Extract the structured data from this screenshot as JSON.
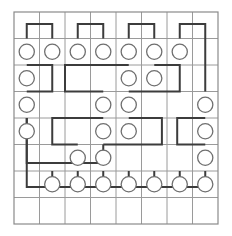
{
  "diagram": {
    "type": "grid-link-diagram",
    "colors": {
      "background": "#ffffff",
      "grid_line": "#9a9a9a",
      "border_line": "#8a8a8a",
      "path_stroke": "#3c3c3c",
      "node_stroke": "#6f6f6f",
      "node_fill": "#ffffff"
    },
    "grid": {
      "columns": 8,
      "rows": 8,
      "origin_x": 14,
      "origin_y": 12,
      "cell_width": 25.5,
      "cell_height": 26.5,
      "line_width": 1,
      "border_width": 1.2
    },
    "node_radius": 7.6,
    "node_stroke_width": 1.3,
    "path_stroke_width": 2.0,
    "nodes": [
      {
        "id": "n1",
        "col": 0,
        "row": 1
      },
      {
        "id": "n2",
        "col": 1,
        "row": 1
      },
      {
        "id": "n3",
        "col": 2,
        "row": 1
      },
      {
        "id": "n4",
        "col": 3,
        "row": 1
      },
      {
        "id": "n5",
        "col": 4,
        "row": 1
      },
      {
        "id": "n6",
        "col": 5,
        "row": 1
      },
      {
        "id": "n7",
        "col": 6,
        "row": 1
      },
      {
        "id": "n8",
        "col": 0,
        "row": 2
      },
      {
        "id": "n9",
        "col": 4,
        "row": 2
      },
      {
        "id": "n10",
        "col": 5,
        "row": 2
      },
      {
        "id": "n11",
        "col": 0,
        "row": 3
      },
      {
        "id": "n12",
        "col": 3,
        "row": 3
      },
      {
        "id": "n13",
        "col": 4,
        "row": 3
      },
      {
        "id": "n14",
        "col": 7,
        "row": 3
      },
      {
        "id": "n15",
        "col": 0,
        "row": 4
      },
      {
        "id": "n16",
        "col": 3,
        "row": 4
      },
      {
        "id": "n17",
        "col": 4,
        "row": 4
      },
      {
        "id": "n18",
        "col": 7,
        "row": 4
      },
      {
        "id": "n19",
        "col": 2,
        "row": 5
      },
      {
        "id": "n20",
        "col": 3,
        "row": 5
      },
      {
        "id": "n21",
        "col": 7,
        "row": 5
      },
      {
        "id": "n22",
        "col": 1,
        "row": 6
      },
      {
        "id": "n23",
        "col": 2,
        "row": 6
      },
      {
        "id": "n24",
        "col": 3,
        "row": 6
      },
      {
        "id": "n25",
        "col": 4,
        "row": 6
      },
      {
        "id": "n26",
        "col": 5,
        "row": 6
      },
      {
        "id": "n27",
        "col": 6,
        "row": 6
      },
      {
        "id": "n28",
        "col": 7,
        "row": 6
      }
    ],
    "links": [
      {
        "id": "l1",
        "from": "n1",
        "to": "n2",
        "waypoints": [
          [
            0.5,
            1.0
          ],
          [
            0.5,
            0.45
          ],
          [
            1.5,
            0.45
          ],
          [
            1.5,
            1.0
          ]
        ]
      },
      {
        "id": "l2",
        "from": "n3",
        "to": "n4",
        "waypoints": [
          [
            2.5,
            1.0
          ],
          [
            2.5,
            0.45
          ],
          [
            3.5,
            0.45
          ],
          [
            3.5,
            1.0
          ]
        ]
      },
      {
        "id": "l3",
        "from": "n5",
        "to": "n6",
        "waypoints": [
          [
            4.5,
            1.0
          ],
          [
            4.5,
            0.45
          ],
          [
            5.5,
            0.45
          ],
          [
            5.5,
            1.0
          ]
        ]
      },
      {
        "id": "l4",
        "from": "n7",
        "to": "n14",
        "waypoints": [
          [
            6.5,
            1.0
          ],
          [
            6.5,
            0.45
          ],
          [
            7.5,
            0.45
          ],
          [
            7.5,
            3.0
          ]
        ]
      },
      {
        "id": "l5",
        "from": "n8",
        "to": "n11",
        "waypoints": [
          [
            0.5,
            2.0
          ],
          [
            1.5,
            2.0
          ],
          [
            1.5,
            3.0
          ],
          [
            0.5,
            3.0
          ]
        ]
      },
      {
        "id": "l6",
        "from": "n9",
        "to": "n12",
        "waypoints": [
          [
            4.5,
            2.0
          ],
          [
            2.0,
            2.0
          ],
          [
            2.0,
            3.0
          ],
          [
            3.5,
            3.0
          ]
        ]
      },
      {
        "id": "l7",
        "from": "n10",
        "to": "n13",
        "waypoints": [
          [
            5.5,
            2.0
          ],
          [
            6.5,
            2.0
          ],
          [
            6.5,
            3.0
          ],
          [
            4.5,
            3.0
          ]
        ]
      },
      {
        "id": "l8",
        "from": "n15",
        "to": "n20",
        "waypoints": [
          [
            0.5,
            4.0
          ],
          [
            0.5,
            5.7
          ],
          [
            3.5,
            5.7
          ],
          [
            3.5,
            5.0
          ]
        ]
      },
      {
        "id": "l9",
        "from": "n16",
        "to": "n19",
        "waypoints": [
          [
            3.5,
            4.0
          ],
          [
            1.5,
            4.0
          ],
          [
            1.5,
            5.0
          ],
          [
            2.5,
            5.0
          ]
        ]
      },
      {
        "id": "l10",
        "from": "n17",
        "to": "n20",
        "waypoints": [
          [
            4.5,
            4.0
          ],
          [
            5.8,
            4.0
          ],
          [
            5.8,
            5.0
          ],
          [
            3.5,
            5.0
          ]
        ]
      },
      {
        "id": "l11",
        "from": "n18",
        "to": "n21",
        "waypoints": [
          [
            7.5,
            4.0
          ],
          [
            6.4,
            4.0
          ],
          [
            6.4,
            5.0
          ],
          [
            7.5,
            5.0
          ]
        ]
      },
      {
        "id": "l12",
        "from": "n22",
        "to": "n23",
        "waypoints": [
          [
            1.5,
            6.0
          ],
          [
            1.5,
            6.6
          ],
          [
            2.5,
            6.6
          ],
          [
            2.5,
            6.0
          ]
        ]
      },
      {
        "id": "l13",
        "from": "n24",
        "to": "n25",
        "waypoints": [
          [
            3.5,
            6.0
          ],
          [
            3.5,
            6.6
          ],
          [
            4.5,
            6.6
          ],
          [
            4.5,
            6.0
          ]
        ]
      },
      {
        "id": "l14",
        "from": "n26",
        "to": "n27",
        "waypoints": [
          [
            5.5,
            6.0
          ],
          [
            5.5,
            6.6
          ],
          [
            6.5,
            6.6
          ],
          [
            6.5,
            6.0
          ]
        ]
      },
      {
        "id": "l15",
        "from": "n28",
        "to": "n22",
        "waypoints": [
          [
            7.5,
            6.0
          ],
          [
            7.5,
            6.6
          ],
          [
            0.5,
            6.6
          ],
          [
            0.5,
            4.0
          ]
        ]
      }
    ]
  }
}
